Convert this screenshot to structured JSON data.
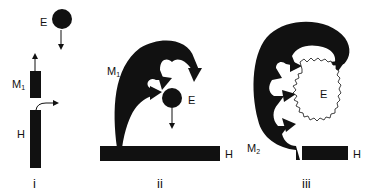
{
  "panels": [
    {
      "id": "i",
      "numeral": "i",
      "labels": {
        "E": "E",
        "M": "M",
        "M_sub": "1",
        "H": "H"
      }
    },
    {
      "id": "ii",
      "numeral": "ii",
      "labels": {
        "E": "E",
        "M": "M",
        "M_sub": "1",
        "H": "H"
      }
    },
    {
      "id": "iii",
      "numeral": "iii",
      "labels": {
        "E": "E",
        "M": "M",
        "M_sub": "2",
        "H": "H"
      }
    }
  ],
  "colors": {
    "ink": "#111111",
    "background": "#ffffff"
  }
}
